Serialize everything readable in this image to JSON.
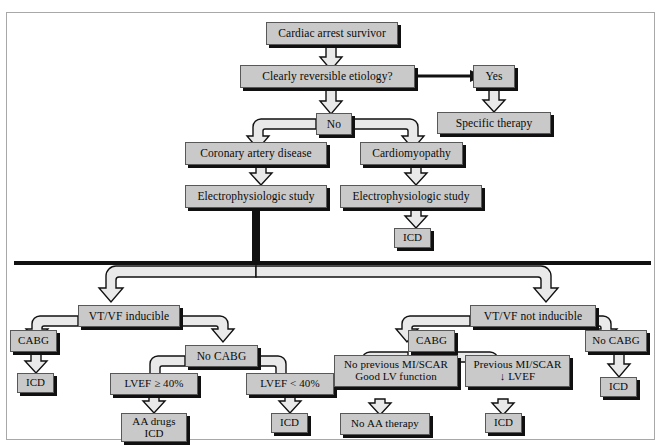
{
  "figure": {
    "type": "clinical-decision-flowchart",
    "title_text": "",
    "box_fill": "#c9c9c9",
    "box_border": "#585858",
    "shadow_color": "#101010",
    "arrow_fill": "#e9e9e9",
    "arrow_outline": "#111111",
    "background": "#ffffff",
    "frame_color": "#a8a8a8"
  },
  "nodes": {
    "root": {
      "label": "Cardiac arrest survivor"
    },
    "reversible": {
      "label": "Clearly reversible etiology?"
    },
    "yes": {
      "label": "Yes"
    },
    "specific_therapy": {
      "label": "Specific therapy"
    },
    "no": {
      "label": "No"
    },
    "cad": {
      "label": "Coronary artery disease"
    },
    "cardiomyopathy": {
      "label": "Cardiomyopathy"
    },
    "eps_left": {
      "label": "Electrophysiologic study"
    },
    "eps_right": {
      "label": "Electrophysiologic study"
    },
    "icd_cm": {
      "label": "ICD"
    },
    "vtvf_inducible": {
      "label": "VT/VF inducible"
    },
    "cabg_left": {
      "label": "CABG"
    },
    "icd_cabg_left": {
      "label": "ICD"
    },
    "no_cabg_left": {
      "label": "No CABG"
    },
    "lvef_ge40": {
      "label": "LVEF ≥ 40%"
    },
    "lvef_lt40": {
      "label": "LVEF < 40%"
    },
    "aa_drugs_icd": {
      "label": "AA drugs\nICD"
    },
    "icd_lvef_lt40": {
      "label": "ICD"
    },
    "vtvf_not_inducible": {
      "label": "VT/VF not inducible"
    },
    "cabg_right": {
      "label": "CABG"
    },
    "no_prev_mi": {
      "label": "No previous MI/SCAR\nGood LV function"
    },
    "prev_mi": {
      "label": "Previous MI/SCAR\n↓ LVEF"
    },
    "no_aa_therapy": {
      "label": "No AA therapy"
    },
    "icd_prev_mi": {
      "label": "ICD"
    },
    "no_cabg_right": {
      "label": "No CABG"
    },
    "icd_no_cabg_right": {
      "label": "ICD"
    }
  },
  "edges": [
    {
      "from": "root",
      "to": "reversible",
      "label": ""
    },
    {
      "from": "reversible",
      "to": "yes",
      "label": ""
    },
    {
      "from": "yes",
      "to": "specific_therapy",
      "label": ""
    },
    {
      "from": "reversible",
      "to": "no",
      "label": ""
    },
    {
      "from": "no",
      "to": "cad",
      "label": ""
    },
    {
      "from": "no",
      "to": "cardiomyopathy",
      "label": ""
    },
    {
      "from": "cad",
      "to": "eps_left",
      "label": ""
    },
    {
      "from": "cardiomyopathy",
      "to": "eps_right",
      "label": ""
    },
    {
      "from": "eps_right",
      "to": "icd_cm",
      "label": ""
    },
    {
      "from": "eps_left",
      "to": "vtvf_inducible",
      "label": ""
    },
    {
      "from": "eps_left",
      "to": "vtvf_not_inducible",
      "label": ""
    },
    {
      "from": "vtvf_inducible",
      "to": "cabg_left",
      "label": ""
    },
    {
      "from": "vtvf_inducible",
      "to": "no_cabg_left",
      "label": ""
    },
    {
      "from": "cabg_left",
      "to": "icd_cabg_left",
      "label": ""
    },
    {
      "from": "no_cabg_left",
      "to": "lvef_ge40",
      "label": ""
    },
    {
      "from": "no_cabg_left",
      "to": "lvef_lt40",
      "label": ""
    },
    {
      "from": "lvef_ge40",
      "to": "aa_drugs_icd",
      "label": ""
    },
    {
      "from": "lvef_lt40",
      "to": "icd_lvef_lt40",
      "label": ""
    },
    {
      "from": "vtvf_not_inducible",
      "to": "cabg_right",
      "label": ""
    },
    {
      "from": "vtvf_not_inducible",
      "to": "no_cabg_right",
      "label": ""
    },
    {
      "from": "cabg_right",
      "to": "no_prev_mi",
      "label": ""
    },
    {
      "from": "cabg_right",
      "to": "prev_mi",
      "label": ""
    },
    {
      "from": "no_prev_mi",
      "to": "no_aa_therapy",
      "label": ""
    },
    {
      "from": "prev_mi",
      "to": "icd_prev_mi",
      "label": ""
    },
    {
      "from": "no_cabg_right",
      "to": "icd_no_cabg_right",
      "label": ""
    }
  ]
}
